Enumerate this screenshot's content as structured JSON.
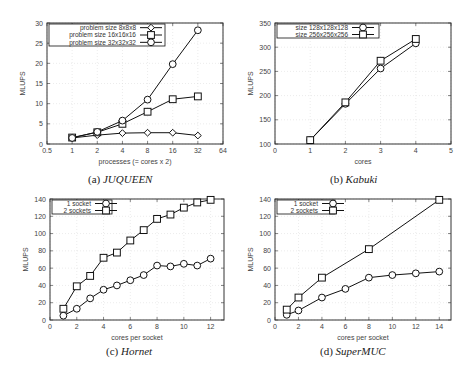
{
  "figure": {
    "captions": [
      {
        "label": "(a)",
        "name": "JUQUEEN"
      },
      {
        "label": "(b)",
        "name": "Kabuki"
      },
      {
        "label": "(c)",
        "name": "Hornet"
      },
      {
        "label": "(d)",
        "name": "SuperMUC"
      }
    ]
  },
  "chart_data": [
    {
      "id": "a",
      "type": "line",
      "title": "(a) JUQUEEN",
      "xlabel": "processes (= cores x 2)",
      "ylabel": "MLUPS",
      "xscale": "log2",
      "xlim": [
        0.5,
        64
      ],
      "ylim": [
        0,
        30
      ],
      "xticks": [
        0.5,
        1,
        2,
        4,
        8,
        16,
        32,
        64
      ],
      "xtick_labels": [
        "0.5",
        "1",
        "2",
        "4",
        "8",
        "16",
        "32",
        "64"
      ],
      "yticks": [
        0,
        5,
        10,
        15,
        20,
        25,
        30
      ],
      "grid": true,
      "legend_position": "top-left",
      "x": [
        1,
        2,
        4,
        8,
        16,
        32
      ],
      "series": [
        {
          "name": "problem size    8x8x8",
          "marker": "diamond",
          "values": [
            1.5,
            2.2,
            2.7,
            2.8,
            2.8,
            2.1
          ]
        },
        {
          "name": "problem size 16x16x16",
          "marker": "square",
          "values": [
            1.6,
            2.9,
            5.0,
            8.0,
            11.1,
            11.8
          ]
        },
        {
          "name": "problem size 32x32x32",
          "marker": "circle",
          "values": [
            1.5,
            3.0,
            5.8,
            11.0,
            19.8,
            28.2
          ]
        }
      ]
    },
    {
      "id": "b",
      "type": "line",
      "title": "(b) Kabuki",
      "xlabel": "cores",
      "ylabel": "MLUPS",
      "xlim": [
        0,
        5
      ],
      "ylim": [
        100,
        350
      ],
      "xticks": [
        0,
        1,
        2,
        3,
        4,
        5
      ],
      "yticks": [
        100,
        150,
        200,
        250,
        300,
        350
      ],
      "grid": true,
      "legend_position": "top-left",
      "x": [
        1,
        2,
        3,
        4
      ],
      "series": [
        {
          "name": "size 128x128x128",
          "marker": "circle",
          "values": [
            108,
            183,
            256,
            308
          ]
        },
        {
          "name": "size 256x256x256",
          "marker": "square",
          "values": [
            108,
            186,
            272,
            317
          ]
        }
      ]
    },
    {
      "id": "c",
      "type": "line",
      "title": "(c) Hornet",
      "xlabel": "cores per socket",
      "ylabel": "MLUPS",
      "xlim": [
        0,
        13
      ],
      "ylim": [
        0,
        140
      ],
      "xticks": [
        0,
        2,
        4,
        6,
        8,
        10,
        12
      ],
      "yticks": [
        0,
        20,
        40,
        60,
        80,
        100,
        120,
        140
      ],
      "grid": true,
      "legend_position": "top-left",
      "x": [
        1,
        2,
        3,
        4,
        5,
        6,
        7,
        8,
        9,
        10,
        11,
        12
      ],
      "series": [
        {
          "name": "1 socket",
          "marker": "circle",
          "values": [
            5,
            13,
            25,
            35,
            40,
            46,
            52,
            63,
            62,
            65,
            63,
            71
          ]
        },
        {
          "name": "2 sockets",
          "marker": "square",
          "values": [
            13,
            39,
            51,
            72,
            78,
            92,
            104,
            117,
            122,
            130,
            136,
            139
          ]
        }
      ]
    },
    {
      "id": "d",
      "type": "line",
      "title": "(d) SuperMUC",
      "xlabel": "cores per socket",
      "ylabel": "MLUPS",
      "xlim": [
        0,
        15
      ],
      "ylim": [
        0,
        140
      ],
      "xticks": [
        0,
        2,
        4,
        6,
        8,
        10,
        12,
        14
      ],
      "yticks": [
        0,
        20,
        40,
        60,
        80,
        100,
        120,
        140
      ],
      "grid": true,
      "legend_position": "top-left",
      "x": [
        1,
        2,
        4,
        6,
        8,
        10,
        12,
        14
      ],
      "series": [
        {
          "name": "1 socket",
          "marker": "circle",
          "x": [
            1,
            2,
            4,
            6,
            8,
            10,
            12,
            14
          ],
          "values": [
            6,
            11,
            26,
            36,
            49,
            52,
            54,
            56
          ]
        },
        {
          "name": "2 sockets",
          "marker": "square",
          "x": [
            1,
            2,
            4,
            8,
            14
          ],
          "values": [
            12,
            26,
            49,
            82,
            139
          ]
        }
      ]
    }
  ]
}
